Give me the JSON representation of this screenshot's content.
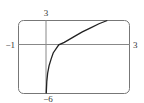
{
  "chart_data": {
    "type": "line",
    "title": "",
    "xlabel": "",
    "ylabel": "",
    "xlim": [
      -1,
      3
    ],
    "ylim": [
      -6,
      3
    ],
    "grid": false,
    "legend": null,
    "x_tick_labels": {
      "left": "−1",
      "right": "3"
    },
    "y_tick_labels": {
      "top": "3",
      "bottom": "−6"
    },
    "series": [
      {
        "name": "curve",
        "x": [
          0.0,
          0.02,
          0.05,
          0.1,
          0.18,
          0.25,
          0.45,
          0.65,
          1.05,
          1.3,
          1.6,
          1.9,
          2.2
        ],
        "y": [
          -6.0,
          -4.5,
          -3.5,
          -2.6,
          -1.7,
          -1.0,
          0.0,
          0.3,
          1.1,
          1.6,
          2.1,
          2.6,
          3.0
        ]
      }
    ]
  },
  "axes": {
    "x_min_label": "−1",
    "x_max_label": "3",
    "y_max_label": "3",
    "y_min_label": "−6"
  },
  "colors": {
    "frame": "#777777",
    "axis": "#777777",
    "curve": "#222222"
  }
}
